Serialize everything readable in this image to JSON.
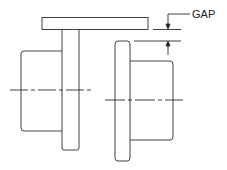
{
  "diagram": {
    "labels": {
      "gap": "GAP"
    },
    "parts": [
      "straightedge",
      "left-flange",
      "left-hub",
      "right-flange",
      "right-hub",
      "centerlines",
      "gap-dimension"
    ],
    "colors": {
      "stroke": "#2a2a2a",
      "background": "#ffffff"
    }
  }
}
